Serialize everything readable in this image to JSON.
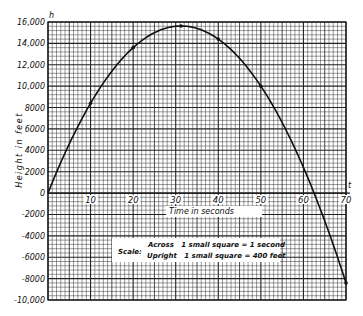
{
  "chart_data": {
    "type": "line",
    "title": "",
    "xlabel": "Time in seconds",
    "ylabel": "Height in feet",
    "x_axis_symbol": "t",
    "y_axis_symbol": "h",
    "xlim": [
      0,
      70
    ],
    "ylim": [
      -10000,
      16000
    ],
    "x_ticks": [
      10,
      20,
      30,
      40,
      50,
      60,
      70
    ],
    "x_tick_labels": [
      "10",
      "20",
      "30",
      "40",
      "50",
      "60",
      "70"
    ],
    "y_ticks": [
      16000,
      14000,
      12000,
      10000,
      8000,
      6000,
      4000,
      2000,
      0,
      -2000,
      -4000,
      -6000,
      -8000,
      -10000
    ],
    "y_tick_labels": [
      "16,000",
      "14,000",
      "12,000",
      "10,000",
      "8000",
      "6000",
      "4000",
      "2000",
      "0",
      "-2000",
      "-4000",
      "-6000",
      "-8000",
      "-10,000"
    ],
    "grid": true,
    "grid_minor_x": 1,
    "grid_minor_y": 400,
    "grid_major_x": 10,
    "grid_major_y": 2000,
    "series": [
      {
        "name": "h = 1000t - 16t^2",
        "x": [
          0,
          5,
          10,
          15,
          20,
          25,
          31.25,
          35,
          40,
          45,
          50,
          55,
          60,
          62.5,
          65,
          70
        ],
        "values": [
          0,
          4600,
          8400,
          11400,
          13600,
          15000,
          15625,
          15400,
          14400,
          12600,
          10000,
          6600,
          2400,
          0,
          -2600,
          -8400
        ]
      }
    ],
    "marked_points": [
      {
        "x": 10,
        "y": 8400
      },
      {
        "x": 20,
        "y": 13600
      },
      {
        "x": 31.25,
        "y": 15625
      },
      {
        "x": 40,
        "y": 14400
      },
      {
        "x": 50,
        "y": 10000
      },
      {
        "x": 70,
        "y": -8400
      }
    ],
    "annotation": {
      "label": "Scale:",
      "line1": "Across   1 small square = 1 second",
      "line2": "Upright   1 small square = 400 feet"
    }
  },
  "labels": {
    "y_symbol": "h",
    "x_symbol": "t",
    "xlabel": "Time in seconds",
    "ylabel": "Height in feet",
    "scale_label": "Scale:",
    "scale_line1": "Across   1 small square = 1 second",
    "scale_line2": "Upright   1 small square = 400 feet"
  }
}
